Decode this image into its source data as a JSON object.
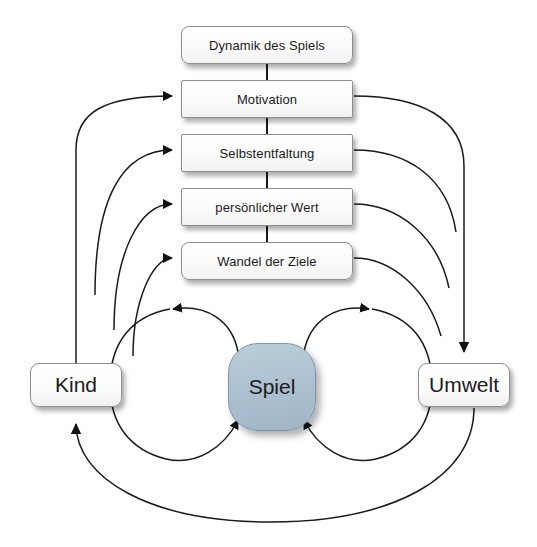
{
  "diagram": {
    "title_text": "",
    "language": "de",
    "background_color": "#ffffff",
    "line_color": "#1a1a1a",
    "box_fill": "#fdfdfd",
    "box_border": "#8e8e8e",
    "spiel_fill": "#aec2d1",
    "spiel_border": "#7d95a8",
    "stack": [
      {
        "id": "dynamik",
        "label": "Dynamik des Spiels"
      },
      {
        "id": "motivation",
        "label": "Motivation"
      },
      {
        "id": "selbstentfaltung",
        "label": "Selbstentfaltung"
      },
      {
        "id": "persoenlicher-wert",
        "label": "persönlicher Wert"
      },
      {
        "id": "wandel",
        "label": "Wandel der Ziele"
      }
    ],
    "actors": {
      "left": {
        "id": "kind",
        "label": "Kind"
      },
      "center": {
        "id": "spiel",
        "label": "Spiel"
      },
      "right": {
        "id": "umwelt",
        "label": "Umwelt"
      }
    },
    "connections": [
      {
        "from": "dynamik",
        "to": "motivation",
        "kind": "vertical-link"
      },
      {
        "from": "motivation",
        "to": "selbstentfaltung",
        "kind": "vertical-link"
      },
      {
        "from": "selbstentfaltung",
        "to": "persoenlicher-wert",
        "kind": "vertical-link"
      },
      {
        "from": "persoenlicher-wert",
        "to": "wandel",
        "kind": "vertical-link"
      },
      {
        "from": "kind",
        "to": "motivation",
        "kind": "curve-arrow-right"
      },
      {
        "from": "kind",
        "to": "selbstentfaltung",
        "kind": "curve-arrow-right"
      },
      {
        "from": "kind",
        "to": "persoenlicher-wert",
        "kind": "curve-arrow-right"
      },
      {
        "from": "kind",
        "to": "wandel",
        "kind": "curve-arrow-right"
      },
      {
        "from": "motivation",
        "to": "umwelt",
        "kind": "curve-arrow-down"
      },
      {
        "from": "selbstentfaltung",
        "to": "umwelt",
        "kind": "curve-arrow-down"
      },
      {
        "from": "persoenlicher-wert",
        "to": "umwelt",
        "kind": "curve-arrow-down"
      },
      {
        "from": "wandel",
        "to": "umwelt",
        "kind": "curve-arrow-down"
      },
      {
        "from": "spiel",
        "to": "kind",
        "kind": "loop-top-left-arrow"
      },
      {
        "from": "kind",
        "to": "spiel",
        "kind": "loop-bottom-left-arrow"
      },
      {
        "from": "spiel",
        "to": "umwelt",
        "kind": "loop-top-right-arrow"
      },
      {
        "from": "umwelt",
        "to": "spiel",
        "kind": "loop-bottom-right-arrow"
      },
      {
        "from": "umwelt",
        "to": "kind",
        "kind": "outer-bottom-arc-arrow"
      }
    ]
  }
}
